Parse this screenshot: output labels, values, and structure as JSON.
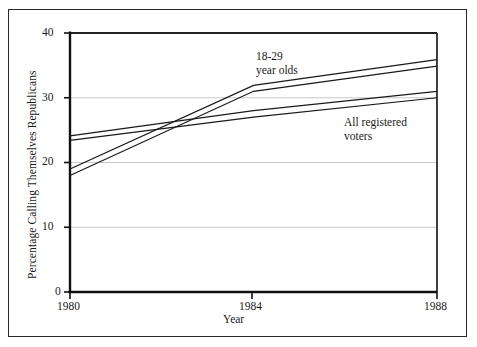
{
  "figure": {
    "frame_color": "#2a2a2a",
    "background": "#ffffff",
    "axis_color": "#111111",
    "grid_color": "#c9c9c9",
    "line_color": "#1a1a1a"
  },
  "chart_data": {
    "type": "line",
    "title": "",
    "xlabel": "Year",
    "ylabel": "Percentage Calling Themselves Republicans",
    "x": [
      1980,
      1984,
      1988
    ],
    "xtick_labels": [
      "1980",
      "1984",
      "1988"
    ],
    "ytick_labels": [
      "0",
      "10",
      "20",
      "30",
      "40"
    ],
    "ytick_values": [
      0,
      10,
      20,
      30,
      40
    ],
    "xlim": [
      1980,
      1988
    ],
    "ylim": [
      0,
      40
    ],
    "grid": "horizontal",
    "legend_position": "inline-annotations",
    "series": [
      {
        "name": "18-29 year olds",
        "annotation": "18-29 year olds",
        "band": true,
        "values_upper": [
          19.0,
          31.9,
          35.9
        ],
        "values_lower": [
          18.0,
          31.0,
          34.9
        ]
      },
      {
        "name": "All registered voters",
        "annotation": "All registered voters",
        "band": true,
        "values_upper": [
          24.1,
          28.0,
          31.0
        ],
        "values_lower": [
          23.4,
          27.0,
          30.0
        ]
      }
    ],
    "annotations": [
      {
        "text_line1": "18-29",
        "text_line2": "year olds"
      },
      {
        "text_line1": "All registered",
        "text_line2": "voters"
      }
    ]
  },
  "axes": {
    "y_title": "Percentage Calling Themselves Republicans",
    "x_title": "Year",
    "y_ticks": [
      {
        "label": "40"
      },
      {
        "label": "30"
      },
      {
        "label": "20"
      },
      {
        "label": "10"
      },
      {
        "label": "0"
      }
    ],
    "x_ticks": [
      {
        "label": "1980"
      },
      {
        "label": "1984"
      },
      {
        "label": "1988"
      }
    ]
  },
  "annotations": {
    "youth": {
      "line1": "18-29",
      "line2": "year olds"
    },
    "all_voters": {
      "line1": "All registered",
      "line2": "voters"
    }
  }
}
